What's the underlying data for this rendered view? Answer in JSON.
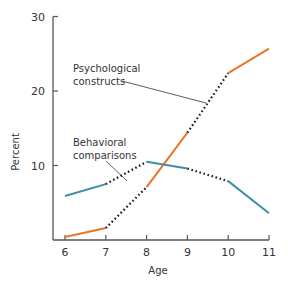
{
  "chart_data": {
    "type": "line",
    "title": "",
    "xlabel": "Age",
    "ylabel": "Percent",
    "x": [
      6,
      7,
      8,
      9,
      10,
      11
    ],
    "xticks": [
      "6",
      "7",
      "8",
      "9",
      "10",
      "11"
    ],
    "yticks": [
      "10",
      "20",
      "30"
    ],
    "ylim": [
      0,
      30
    ],
    "grid": false,
    "legend": "inline annotations",
    "series": [
      {
        "name": "Psychological constructs",
        "color": "#E8752A",
        "values": [
          0.4,
          1.6,
          7.1,
          14.4,
          22.4,
          25.7
        ],
        "dotted_segments": [
          [
            7,
            8
          ],
          [
            9,
            10
          ]
        ]
      },
      {
        "name": "Behavioral comparisons",
        "color": "#3E8FA6",
        "values": [
          5.9,
          7.5,
          10.5,
          9.6,
          7.9,
          3.6
        ],
        "dotted_segments": [
          [
            7,
            8
          ],
          [
            9,
            10
          ]
        ]
      }
    ],
    "annotations": [
      {
        "text_lines": [
          "Psychological",
          "constructs"
        ],
        "target_series": "Psychological constructs"
      },
      {
        "text_lines": [
          "Behavioral",
          "comparisons"
        ],
        "target_series": "Behavioral comparisons"
      }
    ]
  }
}
